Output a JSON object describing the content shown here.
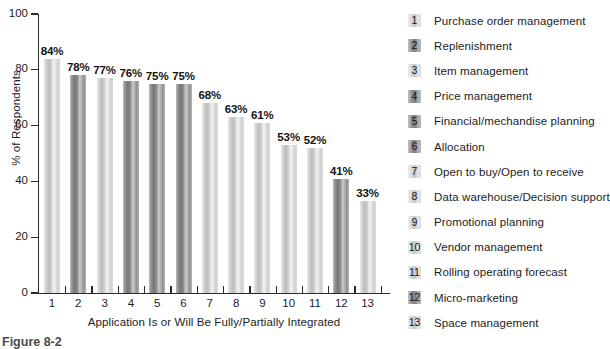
{
  "chart_data": {
    "type": "bar",
    "title": "",
    "xlabel": "Application Is or Will Be Fully/Partially Integrated",
    "ylabel": "% of Respondents",
    "ylim": [
      0,
      100
    ],
    "yticks": [
      "0",
      "20",
      "40",
      "60",
      "80",
      "100"
    ],
    "grid": false,
    "legend_position": "right",
    "categories": [
      "1",
      "2",
      "3",
      "4",
      "5",
      "6",
      "7",
      "8",
      "9",
      "10",
      "11",
      "12",
      "13"
    ],
    "values": [
      84,
      78,
      77,
      76,
      75,
      75,
      68,
      63,
      61,
      53,
      52,
      41,
      33
    ],
    "value_labels": [
      "84%",
      "78%",
      "77%",
      "76%",
      "75%",
      "75%",
      "68%",
      "63%",
      "61%",
      "53%",
      "52%",
      "41%",
      "33%"
    ],
    "bar_shades": [
      "light",
      "dark",
      "light",
      "dark",
      "dark",
      "dark",
      "light",
      "light",
      "light",
      "light",
      "light",
      "dark",
      "light"
    ],
    "legend": [
      {
        "num": "1",
        "label": "Purchase order management"
      },
      {
        "num": "2",
        "label": "Replenishment"
      },
      {
        "num": "3",
        "label": "Item management"
      },
      {
        "num": "4",
        "label": "Price management"
      },
      {
        "num": "5",
        "label": "Financial/mechandise planning"
      },
      {
        "num": "6",
        "label": "Allocation"
      },
      {
        "num": "7",
        "label": "Open to buy/Open to receive"
      },
      {
        "num": "8",
        "label": "Data warehouse/Decision support"
      },
      {
        "num": "9",
        "label": "Promotional planning"
      },
      {
        "num": "10",
        "label": "Vendor management"
      },
      {
        "num": "11",
        "label": "Rolling operating forecast"
      },
      {
        "num": "12",
        "label": "Micro-marketing"
      },
      {
        "num": "13",
        "label": "Space management"
      }
    ]
  },
  "caption": "Figure 8-2"
}
